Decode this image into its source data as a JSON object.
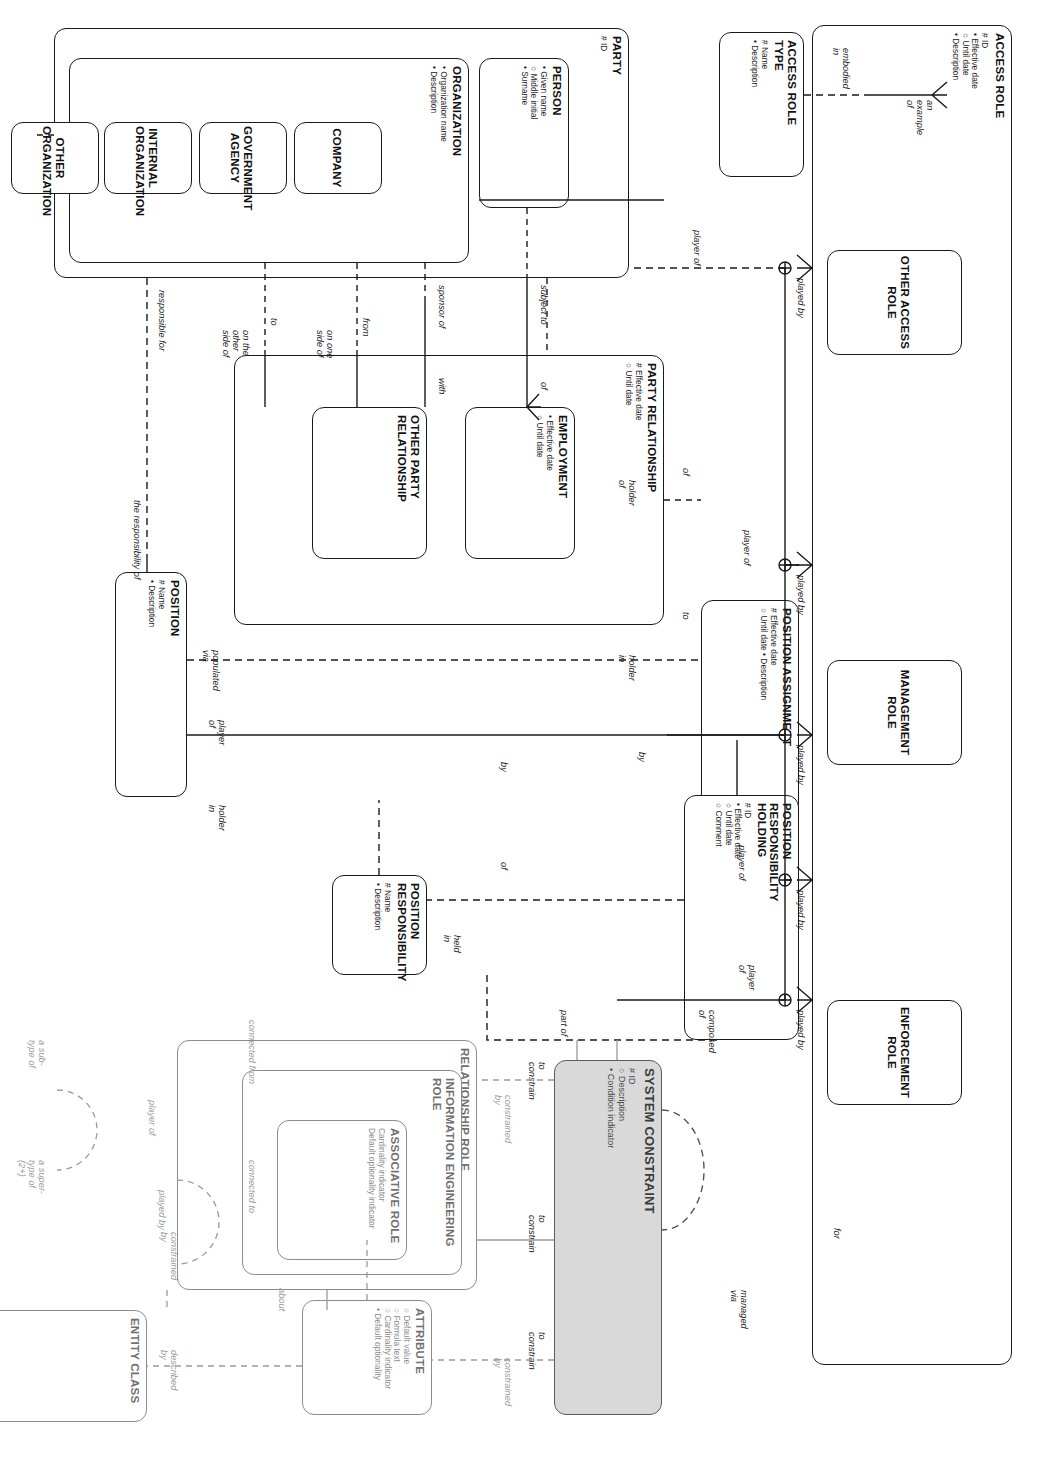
{
  "diagram": {
    "style": {
      "line_color": "#1a1a1a",
      "faded_color": "#9a9a9a",
      "shaded_fill": "#d9d9d9"
    }
  },
  "entities": {
    "access_role": {
      "name": "ACCESS ROLE",
      "attrs": "# ID\n• Effective date\n○ Until date\n• Description"
    },
    "access_role_type": {
      "name": "ACCESS ROLE\nTYPE",
      "attrs": "# Name\n• Description"
    },
    "enforcement_role": {
      "name": "ENFORCEMENT\nROLE",
      "attrs": ""
    },
    "management_role": {
      "name": "MANAGEMENT\nROLE",
      "attrs": ""
    },
    "other_access_role": {
      "name": "OTHER ACCESS\nROLE",
      "attrs": ""
    },
    "party": {
      "name": "PARTY",
      "attrs": "# ID"
    },
    "person": {
      "name": "PERSON",
      "attrs": "• Given name\n○ Middle initial\n• Surname"
    },
    "organization": {
      "name": "ORGANIZATION",
      "attrs": "• Organization name\n• Description"
    },
    "company": {
      "name": "COMPANY",
      "attrs": ""
    },
    "government_agency": {
      "name": "GOVERNMENT\nAGENCY",
      "attrs": ""
    },
    "internal_org": {
      "name": "INTERNAL\nORGANIZATION",
      "attrs": ""
    },
    "other_org": {
      "name": "OTHER\nORGANIZATION",
      "attrs": ""
    },
    "party_relationship": {
      "name": "PARTY RELATIONSHIP",
      "attrs": "# Effective date\n○ Until date"
    },
    "employment": {
      "name": "EMPLOYMENT",
      "attrs": "• Effective date\n○ Until date"
    },
    "other_party_rel": {
      "name": "OTHER PARTY\nRELATIONSHIP",
      "attrs": ""
    },
    "position_assignment": {
      "name": "POSITION ASSIGNMENT",
      "attrs": "# Effective date\n○ Until date    • Description"
    },
    "position_resp_hold": {
      "name": "POSITION\nRESPONSIBILITY\nHOLDING",
      "attrs": "# ID\n• Effective date\n○ Until date\n○ Comment"
    },
    "position_resp": {
      "name": "POSITION\nRESPONSIBILITY",
      "attrs": "# Name\n• Description"
    },
    "position": {
      "name": "POSITION",
      "attrs": "# Name\n• Description"
    },
    "system_constraint": {
      "name": "SYSTEM CONSTRAINT",
      "attrs": "# ID\n○ Description\n• Condition indicator"
    },
    "relationship_role": {
      "name": "RELATIONSHIP ROLE",
      "attrs": ""
    },
    "ie_role": {
      "name": "INFORMATION ENGINEERING\nROLE",
      "attrs": ""
    },
    "associative_role": {
      "name": "ASSOCIATIVE ROLE",
      "attrs": "Cardinality indicator\nDefault optionality indicator"
    },
    "attribute": {
      "name": "ATTRIBUTE",
      "attrs": "○ Default value\n○ Formula text\n○ Cardinality indicator\n• Default optionality"
    },
    "entity_class": {
      "name": "ENTITY CLASS",
      "attrs": ""
    }
  },
  "labels": {
    "an_example_of": "an\nexample\nof",
    "embodied_in": "embodied\nin",
    "played_by_1": "played by",
    "played_by_2": "played by",
    "played_by_3": "played by",
    "played_by_4": "played by",
    "played_by_5": "played by",
    "player_of_party": "player of",
    "player_of_posassign": "player of",
    "player_of_prh_1": "player of",
    "player_of_prh_2": "player\nof",
    "for": "for",
    "managed_via": "managed\nvia",
    "subject_to": "subject to",
    "sponsor_of": "sponsor of",
    "of_employment": "of",
    "with_employment": "with",
    "from": "from",
    "on_one_side_of": "on one\nside of",
    "to_other": "to",
    "on_the_other_side_of": "on the\nother\nside of",
    "responsible_for": "responsible for",
    "the_responsibility_of": "the responsibility of",
    "of_partyrel": "of",
    "holder_of": "holder\nof",
    "to_position": "to",
    "holder_in_pa": "holder\nin",
    "by_left": "by",
    "by_right": "by",
    "of_posresp": "of",
    "held_in": "held\nin",
    "populated_via": "populated\nvia",
    "player_of_position": "player\nof",
    "holder_in_position": "holder\nin",
    "composed_of": "composed\nof",
    "part_of": "part of",
    "to_constrain_1": "to\nconstrain",
    "to_constrain_2": "to\nconstrain",
    "to_constrain_3": "to\nconstrain",
    "constrained_by_ie": "constrained\nby",
    "constrained_by_attr": "constrained\nby",
    "constrained_by_ec": "constrained\nby",
    "described_by": "described\nby",
    "about": "about",
    "connected_to": "connected to",
    "connected_from": "connected from",
    "played_by_ec": "played by",
    "player_of_ec": "player of",
    "a_subtype_of": "a sub-\ntype of",
    "a_supertype_of": "a super-\ntype of\n(2+)"
  }
}
